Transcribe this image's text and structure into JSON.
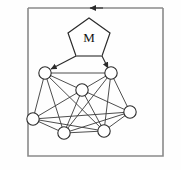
{
  "figure": {
    "title": "",
    "background_color": "#fefefe",
    "border_color": "#8a8a8a",
    "edge_color": "#3a3a3a",
    "node_fill": "#ffffff",
    "node_stroke": "#2b2b2b"
  },
  "diagram": {
    "type": "graph-with-controller",
    "controller": {
      "shape": "pentagon",
      "label": "M",
      "center": [
        89,
        38
      ],
      "radius": 21
    },
    "feedback_loop": {
      "arrow_direction": "left",
      "arrow_position": [
        92,
        8
      ],
      "description": "closed loop around frame"
    },
    "control_arrows": [
      {
        "from": [
          76,
          55
        ],
        "to": [
          47,
          70
        ],
        "target": "node-top-left"
      },
      {
        "from": [
          101,
          55
        ],
        "to": [
          109,
          70
        ],
        "target": "node-top-right"
      }
    ],
    "nodes": [
      {
        "id": "n1",
        "name": "node-top-left",
        "cx": 45,
        "cy": 73,
        "r": 6.2
      },
      {
        "id": "n2",
        "name": "node-top-right",
        "cx": 111,
        "cy": 73,
        "r": 6.2
      },
      {
        "id": "n3",
        "name": "node-center",
        "cx": 82,
        "cy": 90,
        "r": 6.2
      },
      {
        "id": "n4",
        "name": "node-left",
        "cx": 33,
        "cy": 119,
        "r": 6.2
      },
      {
        "id": "n5",
        "name": "node-right",
        "cx": 130,
        "cy": 112,
        "r": 6.2
      },
      {
        "id": "n6",
        "name": "node-bottom-left",
        "cx": 64,
        "cy": 133,
        "r": 6.2
      },
      {
        "id": "n7",
        "name": "node-bottom-right",
        "cx": 104,
        "cy": 131,
        "r": 6.2
      }
    ],
    "edges": [
      [
        "n1",
        "n2"
      ],
      [
        "n1",
        "n3"
      ],
      [
        "n1",
        "n4"
      ],
      [
        "n1",
        "n6"
      ],
      [
        "n1",
        "n7"
      ],
      [
        "n2",
        "n3"
      ],
      [
        "n2",
        "n5"
      ],
      [
        "n2",
        "n6"
      ],
      [
        "n2",
        "n7"
      ],
      [
        "n3",
        "n4"
      ],
      [
        "n3",
        "n5"
      ],
      [
        "n3",
        "n6"
      ],
      [
        "n3",
        "n7"
      ],
      [
        "n4",
        "n5"
      ],
      [
        "n4",
        "n6"
      ],
      [
        "n4",
        "n7"
      ],
      [
        "n5",
        "n6"
      ],
      [
        "n5",
        "n7"
      ],
      [
        "n6",
        "n7"
      ]
    ],
    "node_count": 7,
    "edge_count": 19
  }
}
